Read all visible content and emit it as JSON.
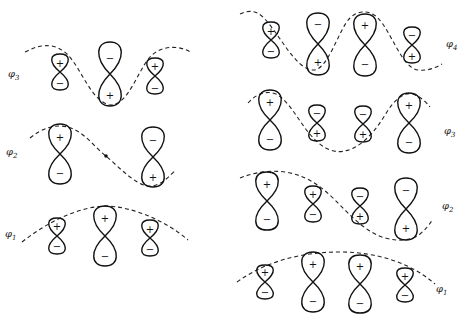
{
  "diagram": {
    "left_panel": {
      "levels": [
        {
          "id": "phi3",
          "label": "φ",
          "sub": "3",
          "signs": [
            [
              "+",
              "−"
            ],
            [
              "−",
              "+"
            ],
            [
              "+",
              "−"
            ]
          ]
        },
        {
          "id": "phi2",
          "label": "φ",
          "sub": "2",
          "signs": [
            [
              "+",
              "−"
            ],
            [
              "−",
              "+"
            ]
          ],
          "node": "central dot (node at middle atom)"
        },
        {
          "id": "phi1",
          "label": "φ",
          "sub": "1",
          "signs": [
            [
              "+",
              "−"
            ],
            [
              "+",
              "−"
            ],
            [
              "+",
              "−"
            ]
          ]
        }
      ]
    },
    "right_panel": {
      "levels": [
        {
          "id": "phi4",
          "label": "φ",
          "sub": "4",
          "signs": [
            [
              "+",
              "−"
            ],
            [
              "−",
              "+"
            ],
            [
              "+",
              "−"
            ],
            [
              "−",
              "+"
            ]
          ]
        },
        {
          "id": "phi3",
          "label": "φ",
          "sub": "3",
          "signs": [
            [
              "+",
              "−"
            ],
            [
              "−",
              "+"
            ],
            [
              "−",
              "+"
            ],
            [
              "+",
              "−"
            ]
          ]
        },
        {
          "id": "phi2",
          "label": "φ",
          "sub": "2",
          "signs": [
            [
              "+",
              "−"
            ],
            [
              "+",
              "−"
            ],
            [
              "−",
              "+"
            ],
            [
              "−",
              "+"
            ]
          ]
        },
        {
          "id": "phi1",
          "label": "φ",
          "sub": "1",
          "signs": [
            [
              "+",
              "−"
            ],
            [
              "+",
              "−"
            ],
            [
              "+",
              "−"
            ],
            [
              "+",
              "−"
            ]
          ]
        }
      ]
    },
    "labels": {
      "l3": "φ",
      "l3s": "3",
      "l2": "φ",
      "l2s": "2",
      "l1": "φ",
      "l1s": "1",
      "r4": "φ",
      "r4s": "4",
      "r3": "φ",
      "r3s": "3",
      "r2": "φ",
      "r2s": "2",
      "r1": "φ",
      "r1s": "1"
    },
    "signs": {
      "plus": "+",
      "minus": "−"
    }
  }
}
